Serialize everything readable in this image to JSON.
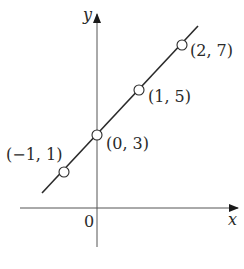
{
  "diagram": {
    "type": "coordinate-plane-line-graph",
    "axes": {
      "x_label": "x",
      "y_label": "y",
      "origin_label": "0"
    },
    "line": {
      "equation_implied": "y = 2x + 3",
      "color": "#2a2a2a"
    },
    "points": [
      {
        "label": "(−1, 1)",
        "x": -1,
        "y": 1
      },
      {
        "label": "(0, 3)",
        "x": 0,
        "y": 3
      },
      {
        "label": "(1, 5)",
        "x": 1,
        "y": 5
      },
      {
        "label": "(2, 7)",
        "x": 2,
        "y": 7
      }
    ],
    "colors": {
      "stroke": "#2a2a2a",
      "axis": "#555555",
      "point_fill": "#ffffff",
      "background": "#ffffff"
    }
  }
}
